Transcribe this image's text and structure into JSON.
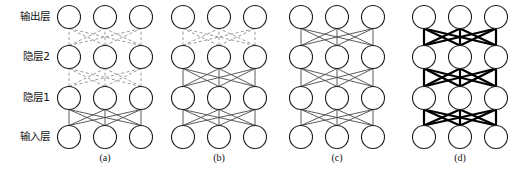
{
  "figure": {
    "background_color": "#ffffff",
    "width": 529,
    "height": 178,
    "layer_labels": [
      {
        "id": "output",
        "text": "输出层",
        "y": 17
      },
      {
        "id": "hidden2",
        "text": "隐层2",
        "y": 57
      },
      {
        "id": "hidden1",
        "text": "隐层1",
        "y": 98
      },
      {
        "id": "input",
        "text": "输入层",
        "y": 137
      }
    ],
    "captions": [
      {
        "id": "a",
        "text": "(a)",
        "x": 105
      },
      {
        "id": "b",
        "text": "(b)",
        "x": 219
      },
      {
        "id": "c",
        "text": "(c)",
        "x": 337
      },
      {
        "id": "d",
        "text": "(d)",
        "x": 460
      }
    ],
    "geometry": {
      "node_radius": 11.5,
      "node_spacing_x": 36,
      "layer_spacing_y": 40,
      "nodes_per_layer": 3,
      "layer_y": [
        17,
        57,
        98,
        137
      ]
    },
    "edge_styles": {
      "dashed": {
        "color": "#9a9a9a",
        "width": 1,
        "dash": "3 2.4"
      },
      "solid": {
        "color": "#4a4a4a",
        "width": 0.9,
        "dash": "none"
      },
      "bold": {
        "color": "#000000",
        "width": 2.2,
        "dash": "none"
      }
    },
    "panels": [
      {
        "id": "a",
        "label": "(a)",
        "node_x": [
          69,
          105,
          141
        ],
        "gaps": [
          {
            "from": "hidden2",
            "to": "output",
            "style": "dashed"
          },
          {
            "from": "hidden1",
            "to": "hidden2",
            "style": "dashed"
          },
          {
            "from": "input",
            "to": "hidden1",
            "style": "solid"
          }
        ]
      },
      {
        "id": "b",
        "label": "(b)",
        "node_x": [
          183,
          219,
          255
        ],
        "gaps": [
          {
            "from": "hidden2",
            "to": "output",
            "style": "dashed"
          },
          {
            "from": "hidden1",
            "to": "hidden2",
            "style": "solid"
          },
          {
            "from": "input",
            "to": "hidden1",
            "style": "solid"
          }
        ]
      },
      {
        "id": "c",
        "label": "(c)",
        "node_x": [
          301,
          337,
          373
        ],
        "gaps": [
          {
            "from": "hidden2",
            "to": "output",
            "style": "solid"
          },
          {
            "from": "hidden1",
            "to": "hidden2",
            "style": "solid"
          },
          {
            "from": "input",
            "to": "hidden1",
            "style": "solid"
          }
        ]
      },
      {
        "id": "d",
        "label": "(d)",
        "node_x": [
          424,
          460,
          496
        ],
        "gaps": [
          {
            "from": "hidden2",
            "to": "output",
            "style": "bold"
          },
          {
            "from": "hidden1",
            "to": "hidden2",
            "style": "bold"
          },
          {
            "from": "input",
            "to": "hidden1",
            "style": "bold"
          }
        ]
      }
    ]
  }
}
